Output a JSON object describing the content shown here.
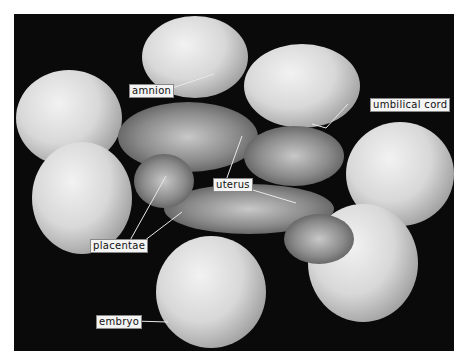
{
  "figure": {
    "background": "#0a0a0a",
    "labels": {
      "amnion": "amnion",
      "umbilical_cord": "umbilical cord",
      "uterus": "uterus",
      "placentae": "placentae",
      "embryo": "embryo"
    }
  }
}
